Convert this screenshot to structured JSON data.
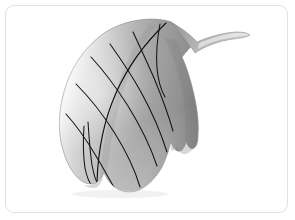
{
  "canvas": {
    "width": 295,
    "height": 220,
    "background_color": "#ffffff"
  },
  "card": {
    "name": "image-card",
    "background_color": "#ffffff",
    "border_color": "#e2e2e2",
    "border_radius": "9px",
    "border_width": "1px"
  },
  "illustration": {
    "subject": "leaf",
    "style": "3d-rendered grayscale shaded leaf",
    "orientation": "tip curving to upper right, base at lower left",
    "alt_text": "Grayscale 3D rendered leaf with curved pointed tip and lobed margins",
    "colors": {
      "highlight": "#fdfdfd",
      "light": "#e8e8e8",
      "mid": "#b4b4b4",
      "shade": "#969696",
      "dark": "#7e7e7e",
      "deep": "#6e6e6e",
      "vein": "#101010",
      "outline": "#8a8a8a"
    },
    "parts": [
      {
        "name": "leaf-blade",
        "label": "Leaf blade"
      },
      {
        "name": "leaf-tip",
        "label": "Curved tip"
      },
      {
        "name": "leaf-stem",
        "label": "Stem"
      },
      {
        "name": "leaf-midrib",
        "label": "Midrib"
      },
      {
        "name": "leaf-veins",
        "label": "Secondary veins"
      },
      {
        "name": "leaf-lobe-notch",
        "label": "Right margin notch"
      },
      {
        "name": "leaf-base-lobes",
        "label": "Basal lobes"
      }
    ],
    "vein_count": 7
  }
}
